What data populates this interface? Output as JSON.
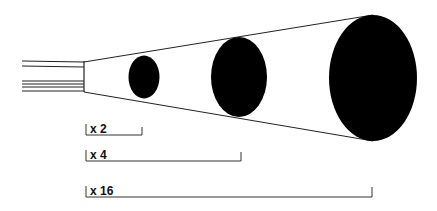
{
  "diagram": {
    "title": "",
    "colors": {
      "ink": "#000000",
      "line": "#222222",
      "background": "#ffffff"
    },
    "source": {
      "name": "tube"
    },
    "ellipses": [
      {
        "name": "small",
        "cx": 144,
        "cy": 77,
        "rx": 15.5,
        "ry": 21.5
      },
      {
        "name": "medium",
        "cx": 239,
        "cy": 77,
        "rx": 28,
        "ry": 40
      },
      {
        "name": "large",
        "cx": 373,
        "cy": 78,
        "rx": 44,
        "ry": 63
      }
    ],
    "scale_bars": [
      {
        "label": "x 2",
        "x1": 86,
        "x2": 142,
        "y": 135
      },
      {
        "label": "x 4",
        "x1": 86,
        "x2": 241,
        "y": 161
      },
      {
        "label": "x 16",
        "x1": 86,
        "x2": 372,
        "y": 197
      }
    ]
  }
}
